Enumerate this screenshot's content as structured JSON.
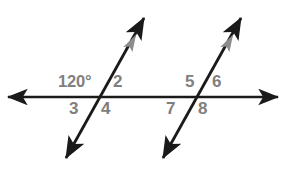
{
  "figure": {
    "background_color": "#ffffff",
    "line_color": "#1a1a1a",
    "label_color": "#808080",
    "parallel_mark_color": "#8c8c8c"
  },
  "lines": [
    {
      "name": "horizontal-line",
      "kind": "double-arrow-line",
      "x1": 8,
      "y1": 97,
      "x2": 278,
      "y2": 97
    },
    {
      "name": "left-transversal",
      "kind": "double-arrow-line",
      "x1": 66,
      "y1": 158,
      "x2": 144,
      "y2": 18
    },
    {
      "name": "right-transversal",
      "kind": "double-arrow-line",
      "x1": 163,
      "y1": 158,
      "x2": 241,
      "y2": 18
    }
  ],
  "intersections": [
    {
      "name": "left-intersection",
      "x": 100,
      "y": 97
    },
    {
      "name": "right-intersection",
      "x": 197,
      "y": 97
    }
  ],
  "parallel_marks": [
    {
      "name": "left-parallel-mark",
      "x": 132,
      "y": 42
    },
    {
      "name": "right-parallel-mark",
      "x": 229,
      "y": 42
    }
  ],
  "angle_labels": [
    {
      "id": "angle-1",
      "text": "120°",
      "x": 58,
      "y": 73,
      "measure": true
    },
    {
      "id": "angle-2",
      "text": "2",
      "x": 113,
      "y": 73,
      "measure": false
    },
    {
      "id": "angle-3",
      "text": "3",
      "x": 69,
      "y": 100,
      "measure": false
    },
    {
      "id": "angle-4",
      "text": "4",
      "x": 101,
      "y": 100,
      "measure": false
    },
    {
      "id": "angle-5",
      "text": "5",
      "x": 185,
      "y": 73,
      "measure": false
    },
    {
      "id": "angle-6",
      "text": "6",
      "x": 212,
      "y": 73,
      "measure": false
    },
    {
      "id": "angle-7",
      "text": "7",
      "x": 166,
      "y": 100,
      "measure": false
    },
    {
      "id": "angle-8",
      "text": "8",
      "x": 198,
      "y": 100,
      "measure": false
    }
  ]
}
